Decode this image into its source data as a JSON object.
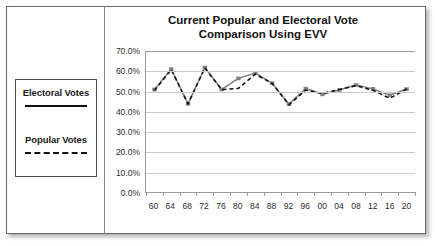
{
  "slide": {
    "title_line1": "Current Popular and Electoral Vote",
    "title_line2": "Comparison Using EVV",
    "title_full": "Current Popular and Electoral Vote\nComparison Using EVV"
  },
  "legend": {
    "electoral_label": "Electoral Votes",
    "popular_label": "Popular Votes",
    "electoral_style": "solid",
    "popular_style": "dashed",
    "electoral_color": "#808080",
    "popular_color": "#111111"
  },
  "chart_data": {
    "type": "line",
    "title": "Current Popular and Electoral Vote Comparison Using EVV",
    "xlabel": "",
    "ylabel": "",
    "ylim": [
      0,
      70
    ],
    "yticks": [
      "0.0%",
      "10.0%",
      "20.0%",
      "30.0%",
      "40.0%",
      "50.0%",
      "60.0%",
      "70.0%"
    ],
    "ytick_values": [
      0,
      10,
      20,
      30,
      40,
      50,
      60,
      70
    ],
    "grid": true,
    "legend_position": "left-panel",
    "categories": [
      "60",
      "64",
      "68",
      "72",
      "76",
      "80",
      "84",
      "88",
      "92",
      "96",
      "00",
      "04",
      "08",
      "12",
      "16",
      "20"
    ],
    "series": [
      {
        "name": "Electoral Votes",
        "style": "solid",
        "color": "#808080",
        "marker": "square",
        "values": [
          50.9,
          61.0,
          43.8,
          61.8,
          50.9,
          56.4,
          59.0,
          54.0,
          43.7,
          51.3,
          48.5,
          50.6,
          53.1,
          51.2,
          48.0,
          51.1
        ]
      },
      {
        "name": "Popular Votes",
        "style": "dashed",
        "color": "#111111",
        "marker": "none",
        "values": [
          50.3,
          60.8,
          43.8,
          61.6,
          50.8,
          51.5,
          58.5,
          54.0,
          43.3,
          50.6,
          48.9,
          50.9,
          52.8,
          50.5,
          46.5,
          51.1
        ]
      }
    ]
  }
}
